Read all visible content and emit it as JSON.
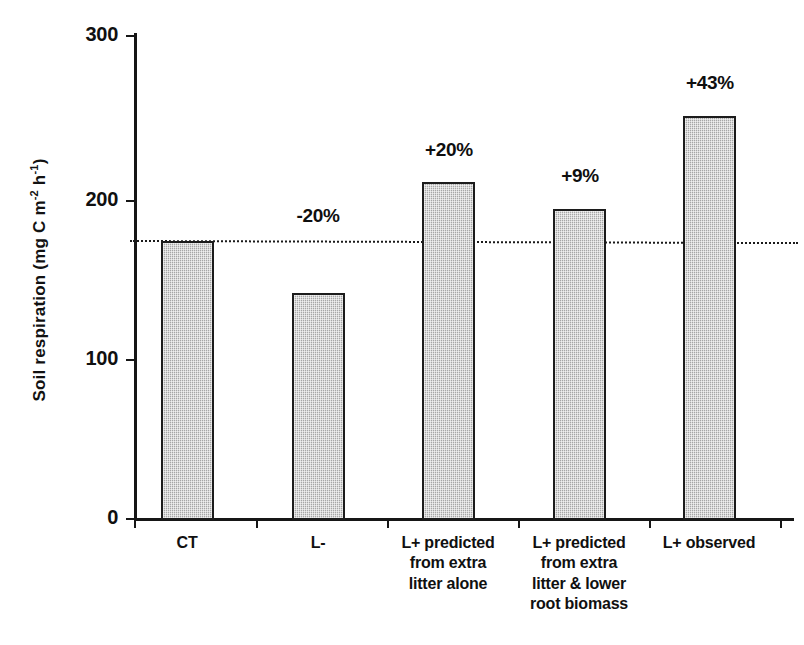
{
  "chart_data": {
    "type": "bar",
    "title": "",
    "xlabel": "",
    "ylabel": "Soil respiration (mg C m-2 h-1)",
    "ylabel_parts": {
      "prefix": "Soil respiration (mg C m",
      "exp1": "-2",
      "mid": " h",
      "exp2": "-1",
      "suffix": ")"
    },
    "ylim": [
      0,
      300
    ],
    "yticks": [
      0,
      100,
      200,
      300
    ],
    "ytick_labels": [
      "0",
      "100",
      "200",
      "300"
    ],
    "grid": false,
    "legend": null,
    "categories": [
      "CT",
      "L-",
      "L+ predicted from extra litter alone",
      "L+ predicted from extra litter & lower root biomass",
      "L+ observed"
    ],
    "category_label_lines": [
      [
        "CT"
      ],
      [
        "L-"
      ],
      [
        "L+ predicted",
        "from extra",
        "litter alone"
      ],
      [
        "L+ predicted",
        "from extra",
        "litter & lower",
        "root biomass"
      ],
      [
        "L+ observed"
      ]
    ],
    "values": [
      172,
      140,
      209,
      192,
      250
    ],
    "annotations": [
      "",
      "-20%",
      "+20%",
      "+9%",
      "+43%"
    ],
    "reference_line": {
      "value": 172,
      "style": "dotted",
      "label": "control level"
    },
    "colors": {
      "bar_fill": "#b9b9b9",
      "bar_border": "#1c1c1c",
      "axis": "#161616",
      "text": "#101010",
      "background": "#ffffff"
    }
  }
}
